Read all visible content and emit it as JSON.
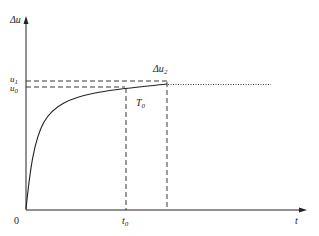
{
  "diagram": {
    "y_axis_label": "Δu",
    "x_axis_label": "t",
    "origin_label": "0",
    "u1_label": "u",
    "u1_sub": "1",
    "u0_label": "u",
    "u0_sub": "0",
    "delta_u2_label": "Δu",
    "delta_u2_sub": "2",
    "t0_label": "t",
    "t0_sub": "0",
    "T0_label": "T",
    "T0_sub": "0",
    "colors": {
      "line": "#222222",
      "background": "#ffffff"
    }
  }
}
